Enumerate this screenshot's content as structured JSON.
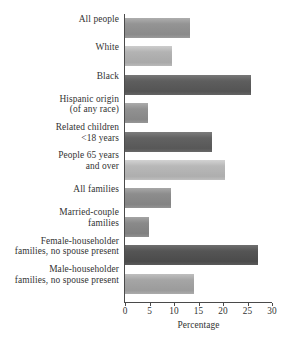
{
  "chart_data": {
    "type": "bar",
    "orientation": "horizontal",
    "title": "",
    "xlabel": "Percentage",
    "ylabel": "",
    "xlim": [
      0,
      30
    ],
    "xticks": [
      0,
      5,
      10,
      15,
      20,
      25,
      30
    ],
    "grid": false,
    "legend": false,
    "categories": [
      "All people",
      "White",
      "Black",
      "Hispanic origin (of any race)",
      "Related children <18 years",
      "People 65 years and over",
      "All families",
      "Married-couple families",
      "Female-householder families, no spouse present",
      "Male-householder families, no spouse present"
    ],
    "category_lines": [
      [
        "All people",
        ""
      ],
      [
        "White",
        ""
      ],
      [
        "Black",
        ""
      ],
      [
        "Hispanic origin",
        "(of any race)"
      ],
      [
        "Related children",
        "<18 years"
      ],
      [
        "People 65 years",
        "and over"
      ],
      [
        "All families",
        ""
      ],
      [
        "Married-couple",
        "families"
      ],
      [
        "Female-householder",
        "families, no spouse present"
      ],
      [
        "Male-householder",
        "families, no spouse present"
      ]
    ],
    "values": [
      13.3,
      9.6,
      25.7,
      4.7,
      17.8,
      20.4,
      9.4,
      4.9,
      27.1,
      14.1
    ],
    "bar_colors": [
      "#949494",
      "#b3b3b3",
      "#5e5e5e",
      "#919191",
      "#626262",
      "#b8b8b8",
      "#8d8d8d",
      "#8a8a8a",
      "#555555",
      "#a5a5a5"
    ],
    "axis_color": "#4a4a4a",
    "text_color": "#333333",
    "background": "#ffffff"
  }
}
